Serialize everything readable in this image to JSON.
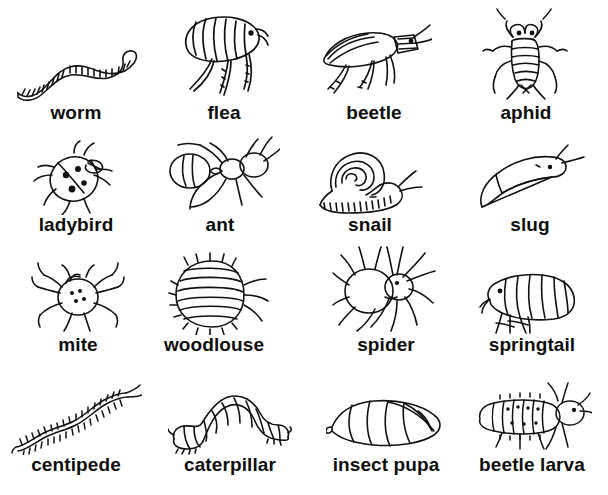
{
  "page": {
    "background_color": "#ffffff",
    "ink_color": "#111111",
    "style": "black-and-white line drawings with bold labels",
    "grid": {
      "columns": 4,
      "rows": 4
    }
  },
  "rows": [
    {
      "cells": [
        {
          "label": "worm",
          "icon": "worm-drawing"
        },
        {
          "label": "flea",
          "icon": "flea-drawing"
        },
        {
          "label": "beetle",
          "icon": "beetle-drawing"
        },
        {
          "label": "aphid",
          "icon": "aphid-drawing"
        }
      ]
    },
    {
      "cells": [
        {
          "label": "ladybird",
          "icon": "ladybird-drawing"
        },
        {
          "label": "ant",
          "icon": "ant-drawing"
        },
        {
          "label": "snail",
          "icon": "snail-drawing"
        },
        {
          "label": "slug",
          "icon": "slug-drawing"
        }
      ]
    },
    {
      "cells": [
        {
          "label": "mite",
          "icon": "mite-drawing"
        },
        {
          "label": "woodlouse",
          "icon": "woodlouse-drawing"
        },
        {
          "label": "spider",
          "icon": "spider-drawing"
        },
        {
          "label": "springtail",
          "icon": "springtail-drawing"
        }
      ]
    },
    {
      "cells": [
        {
          "label": "centipede",
          "icon": "centipede-drawing"
        },
        {
          "label": "caterpillar",
          "icon": "caterpillar-drawing"
        },
        {
          "label": "insect pupa",
          "icon": "insect-pupa-drawing"
        },
        {
          "label": "beetle larva",
          "icon": "beetle-larva-drawing"
        }
      ]
    }
  ]
}
